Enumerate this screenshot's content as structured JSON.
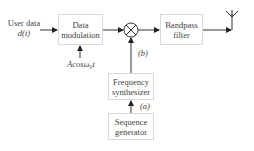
{
  "diagram": {
    "input": {
      "line1": "User data",
      "line2": "d(t)"
    },
    "carrier_label": "Acosω₀t",
    "blocks": {
      "modulator": {
        "line1": "Data",
        "line2": "modulation"
      },
      "bandpass": {
        "line1": "Bandpass",
        "line2": "filter"
      },
      "synth": {
        "line1": "Frequency",
        "line2": "synthesizer"
      },
      "seqgen": {
        "line1": "Sequence",
        "line2": "generator"
      }
    },
    "signal_labels": {
      "b": "(b)",
      "a": "(a)"
    },
    "mixer_symbol": "×",
    "output": "antenna"
  }
}
